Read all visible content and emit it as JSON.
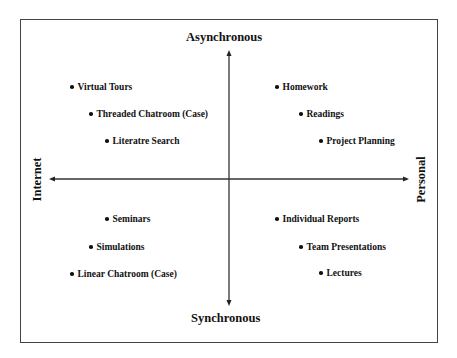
{
  "diagram": {
    "axes": {
      "top": "Asynchronous",
      "bottom": "Synchronous",
      "left": "Internet",
      "right": "Personal"
    },
    "quadrants": {
      "top_left": {
        "items": [
          {
            "label": "Virtual Tours",
            "x": 70,
            "y": 89
          },
          {
            "label": "Threaded Chatroom (Case)",
            "x": 89,
            "y": 116
          },
          {
            "label": "Literatre Search",
            "x": 105,
            "y": 143
          }
        ]
      },
      "top_right": {
        "items": [
          {
            "label": "Homework",
            "x": 275,
            "y": 89
          },
          {
            "label": "Readings",
            "x": 299,
            "y": 116
          },
          {
            "label": "Project Planning",
            "x": 319,
            "y": 143
          }
        ]
      },
      "bottom_left": {
        "items": [
          {
            "label": "Seminars",
            "x": 105,
            "y": 221
          },
          {
            "label": "Simulations",
            "x": 89,
            "y": 249
          },
          {
            "label": "Linear Chatroom  (Case)",
            "x": 70,
            "y": 276
          }
        ]
      },
      "bottom_right": {
        "items": [
          {
            "label": "Individual Reports",
            "x": 275,
            "y": 221
          },
          {
            "label": "Team Presentations",
            "x": 299,
            "y": 249
          },
          {
            "label": "Lectures",
            "x": 319,
            "y": 275
          }
        ]
      }
    },
    "colors": {
      "line": "#333333",
      "text": "#111111",
      "frame": "#444444"
    }
  }
}
